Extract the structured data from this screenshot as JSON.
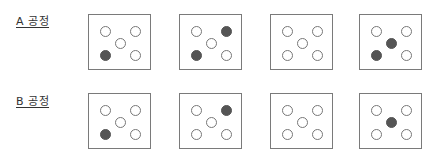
{
  "rows": [
    {
      "label": "A 공정",
      "boxes": [
        {
          "filled": [
            "bl"
          ]
        },
        {
          "filled": [
            "tr",
            "bl"
          ]
        },
        {
          "filled": []
        },
        {
          "filled": [
            "c",
            "bl"
          ]
        }
      ]
    },
    {
      "label": "B 공정",
      "boxes": [
        {
          "filled": [
            "bl"
          ]
        },
        {
          "filled": [
            "tr"
          ]
        },
        {
          "filled": []
        },
        {
          "filled": [
            "c"
          ]
        }
      ]
    }
  ],
  "dot_positions": [
    "tl",
    "tr",
    "c",
    "bl",
    "br"
  ],
  "colors": {
    "filled": "#555555",
    "outline": "#777777",
    "box_border": "#7a7a7a"
  }
}
